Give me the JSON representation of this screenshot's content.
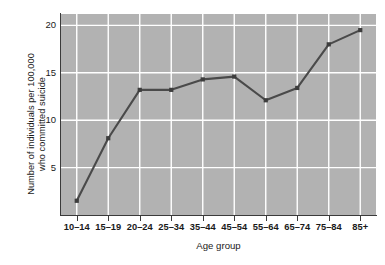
{
  "chart_data": {
    "type": "line",
    "title": "",
    "subtitle": "",
    "xlabel": "Age group",
    "ylabel": "Number of individuals per 100,000 who committed suicide",
    "ylabel_lines": [
      "Number of individuals per 100,000",
      "who committed suicide"
    ],
    "categories": [
      "10–14",
      "15–19",
      "20–24",
      "25–34",
      "35–44",
      "45–54",
      "55–64",
      "65–74",
      "75–84",
      "85+"
    ],
    "values": [
      1.5,
      8.1,
      13.2,
      13.2,
      14.3,
      14.6,
      12.1,
      13.4,
      18.0,
      19.5
    ],
    "series": [
      {
        "name": "Suicide rate",
        "values": [
          1.5,
          8.1,
          13.2,
          13.2,
          14.3,
          14.6,
          12.1,
          13.4,
          18.0,
          19.5
        ]
      }
    ],
    "ylim": [
      0,
      21.2
    ],
    "yticks": [
      5,
      10,
      15,
      20
    ],
    "ytick_labels": [
      "5",
      "10",
      "15",
      "20"
    ],
    "grid": true,
    "grid_color": "#ffffff",
    "legend": false,
    "legend_position": "none",
    "plot_background": "#b2b2b2",
    "line_color": "#4a4a4a",
    "marker_color": "#3d3d3d",
    "marker_shape": "square",
    "axis_color": "#3a3a3a",
    "page_background": "#ffffff"
  }
}
